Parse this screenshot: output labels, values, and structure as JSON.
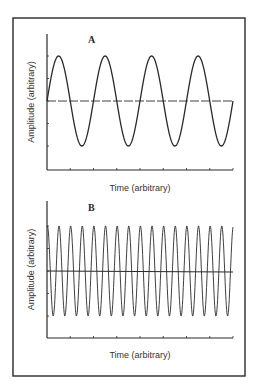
{
  "figure": {
    "frame": {
      "x": 13,
      "y": 18,
      "w": 232,
      "h": 358
    },
    "stroke_color": "#2a2a2a"
  },
  "chart_data": [
    {
      "type": "line",
      "panel_label": "A",
      "title": "",
      "xlabel": "Time (arbitrary)",
      "ylabel": "Amplitude (arbitrary)",
      "description": "Sine wave, low frequency",
      "cycles": 4,
      "phase": "starts at zero crossing, rising",
      "amplitude": 1,
      "ylim": [
        -1.5,
        1.5
      ],
      "xlim": [
        0,
        4
      ],
      "x_ticks": 8,
      "y_ticks": [
        -1,
        -0.5,
        0,
        0.5,
        1
      ],
      "baseline": "dashed zero line",
      "grid": false,
      "legend": null
    },
    {
      "type": "line",
      "panel_label": "B",
      "title": "",
      "xlabel": "Time (arbitrary)",
      "ylabel": "Amplitude (arbitrary)",
      "description": "Sine wave, high frequency",
      "cycles": 16,
      "phase": "starts near peak",
      "amplitude": 1,
      "ylim": [
        -1.5,
        1.5
      ],
      "xlim": [
        0,
        16
      ],
      "x_ticks": 8,
      "y_ticks": [
        -1,
        -0.5,
        0,
        0.5,
        1
      ],
      "baseline": "solid zero line",
      "grid": false,
      "legend": null
    }
  ],
  "panels": [
    {
      "label": "A",
      "xlabel": "Time (arbitrary)",
      "ylabel": "Amplitude (arbitrary)"
    },
    {
      "label": "B",
      "xlabel": "Time (arbitrary)",
      "ylabel": "Amplitude (arbitrary)"
    }
  ],
  "layout": [
    {
      "axis_x0": 47,
      "axis_x1": 233,
      "axis_top": 34,
      "axis_bottom": 170,
      "zero_y": 101,
      "amp_px": 45,
      "label_x": 88,
      "label_y": 43,
      "xlabel_y": 191,
      "ylabel_x": 32,
      "phase_start": 0,
      "dashed": true
    },
    {
      "axis_x0": 47,
      "axis_x1": 233,
      "axis_top": 201,
      "axis_bottom": 338,
      "zero_y": 271,
      "amp_px": 45,
      "label_x": 88,
      "label_y": 211,
      "xlabel_y": 358,
      "ylabel_x": 32,
      "phase_start": 1.35,
      "dashed": false
    }
  ]
}
